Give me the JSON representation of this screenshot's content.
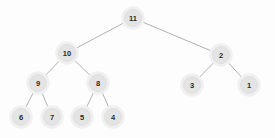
{
  "figure": {
    "background_color": "#fdfdfd",
    "node_fill_color": "#e4e4e4",
    "node_stroke_color": "#dadada",
    "edge_color": "#a8a8a8",
    "label_color": "#2b2b2b",
    "width": 275,
    "height": 138
  },
  "chart_data": {
    "type": "diagram",
    "diagram_type": "binary-tree",
    "title": "",
    "nodes": [
      {
        "id": "n11",
        "label": "11",
        "x": 133,
        "y": 18,
        "r": 8.5,
        "level": 0
      },
      {
        "id": "n10",
        "label": "10",
        "x": 67,
        "y": 53,
        "r": 8.5,
        "level": 1
      },
      {
        "id": "n2",
        "label": "2",
        "x": 221,
        "y": 55,
        "r": 8.5,
        "level": 1
      },
      {
        "id": "n9",
        "label": "9",
        "x": 38,
        "y": 83,
        "r": 8.5,
        "level": 2
      },
      {
        "id": "n8",
        "label": "8",
        "x": 98,
        "y": 83,
        "r": 8.5,
        "level": 2
      },
      {
        "id": "n3",
        "label": "3",
        "x": 192,
        "y": 85,
        "r": 8.5,
        "level": 2
      },
      {
        "id": "n1",
        "label": "1",
        "x": 249,
        "y": 85,
        "r": 8.5,
        "level": 2
      },
      {
        "id": "n6",
        "label": "6",
        "x": 21,
        "y": 117,
        "r": 8.5,
        "level": 3
      },
      {
        "id": "n7",
        "label": "7",
        "x": 52,
        "y": 117,
        "r": 8.5,
        "level": 3
      },
      {
        "id": "n5",
        "label": "5",
        "x": 82,
        "y": 117,
        "r": 8.5,
        "level": 3
      },
      {
        "id": "n4",
        "label": "4",
        "x": 113,
        "y": 117,
        "r": 8.5,
        "level": 3
      }
    ],
    "edges": [
      {
        "from": "n11",
        "to": "n10"
      },
      {
        "from": "n11",
        "to": "n2"
      },
      {
        "from": "n10",
        "to": "n9"
      },
      {
        "from": "n10",
        "to": "n8"
      },
      {
        "from": "n9",
        "to": "n6"
      },
      {
        "from": "n9",
        "to": "n7"
      },
      {
        "from": "n8",
        "to": "n5"
      },
      {
        "from": "n8",
        "to": "n4"
      },
      {
        "from": "n2",
        "to": "n3"
      },
      {
        "from": "n2",
        "to": "n1"
      }
    ]
  }
}
